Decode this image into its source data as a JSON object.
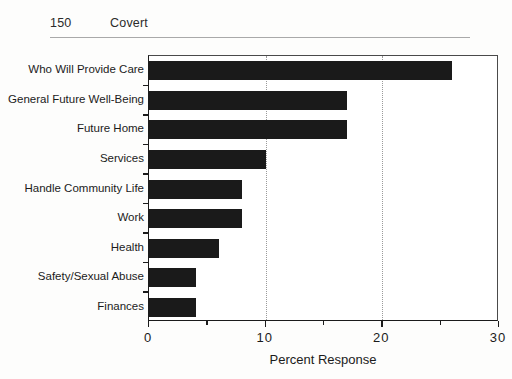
{
  "page": {
    "folio": "150",
    "running_title": "Covert"
  },
  "chart_data": {
    "type": "bar",
    "orientation": "horizontal",
    "title": "",
    "xlabel": "Percent Response",
    "ylabel": "",
    "xlim": [
      0,
      30
    ],
    "xticks": [
      0,
      10,
      20,
      30
    ],
    "xtick_labels": [
      "0",
      "10",
      "20",
      "30"
    ],
    "minor_xticks": [
      5,
      15,
      25
    ],
    "gridlines": [
      10,
      20
    ],
    "grid": "vertical-dotted",
    "legend": "none",
    "bar_color": "#1a1a1a",
    "categories": [
      "Who Will Provide Care",
      "General Future Well-Being",
      "Future Home",
      "Services",
      "Handle Community Life",
      "Work",
      "Health",
      "Safety/Sexual Abuse",
      "Finances"
    ],
    "values": [
      26,
      17,
      17,
      10,
      8,
      8,
      6,
      4,
      4
    ]
  }
}
